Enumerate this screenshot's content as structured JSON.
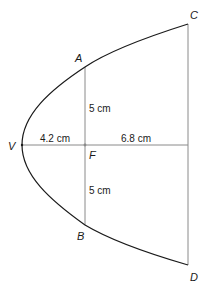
{
  "diagram": {
    "points": {
      "V": "V",
      "A": "A",
      "B": "B",
      "C": "C",
      "D": "D",
      "F": "F"
    },
    "dimensions": {
      "vf": "4.2 cm",
      "f_to_cd": "6.8 cm",
      "fa": "5 cm",
      "fb": "5 cm"
    },
    "colors": {
      "curve": "#1a1a1a",
      "guide": "#8a8a8a",
      "text": "#1a1a1a",
      "background": "#ffffff"
    }
  }
}
